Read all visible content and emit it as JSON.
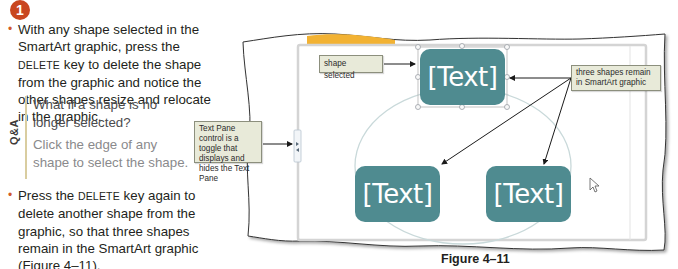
{
  "step": {
    "number": "1"
  },
  "instructions": {
    "bullet1": {
      "part1": "With any shape selected in the SmartArt graphic, press the ",
      "key": "DELETE",
      "part2": " key to delete the shape from the graphic and notice the other shapes resize and relocate in the graphic."
    },
    "bullet2": {
      "part1": "Press the ",
      "key": "DELETE",
      "part2": " key again to delete another shape from the graphic, so that three shapes remain in the SmartArt graphic (Figure 4–11)."
    }
  },
  "qa": {
    "label": "Q&A",
    "question": "What if a shape is no longer selected?",
    "answer": "Click the edge of any shape to select the shape."
  },
  "screenshot": {
    "callouts": {
      "shape_selected": "shape selected",
      "three_shapes": "three shapes remain in SmartArt graphic",
      "text_pane_control": "Text Pane control is a toggle that displays and hides the Text Pane"
    },
    "shapes": [
      {
        "label": "[Text]",
        "position": "top",
        "selected": true
      },
      {
        "label": "[Text]",
        "position": "bottom-left",
        "selected": false
      },
      {
        "label": "[Text]",
        "position": "bottom-right",
        "selected": false
      }
    ],
    "colors": {
      "shape_fill": "#4f8b90",
      "callout_fill": "#e8ead9",
      "ribbon_accent": "#f2b233",
      "step_badge": "#c9461f"
    }
  },
  "figure": {
    "caption": "Figure 4–11"
  }
}
